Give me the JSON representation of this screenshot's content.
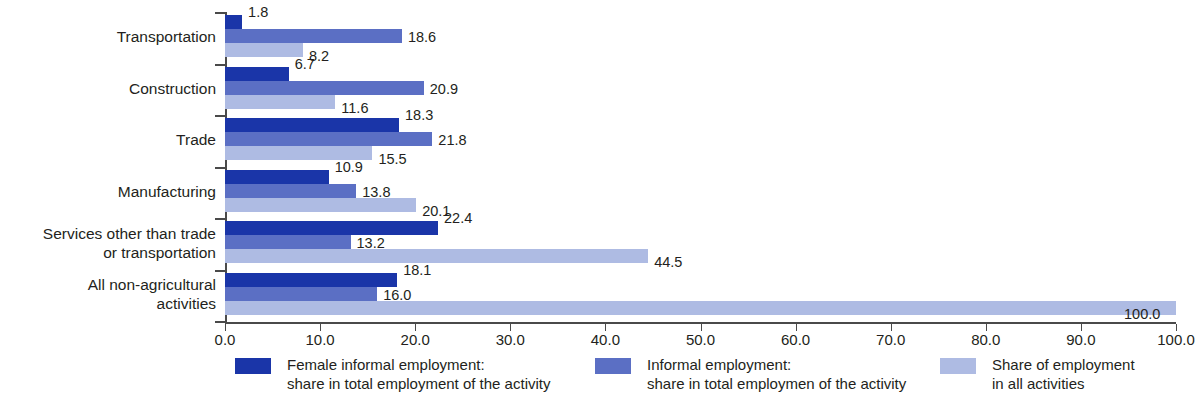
{
  "chart_data": {
    "type": "bar",
    "orientation": "horizontal",
    "title": "",
    "subtitle": "",
    "xlabel": "",
    "ylabel": "",
    "xlim": [
      0,
      100
    ],
    "xticks": [
      "0.0",
      "10.0",
      "20.0",
      "30.0",
      "40.0",
      "50.0",
      "60.0",
      "70.0",
      "80.0",
      "90.0",
      "100.0"
    ],
    "xtick_values": [
      0,
      10,
      20,
      30,
      40,
      50,
      60,
      70,
      80,
      90,
      100
    ],
    "grid": false,
    "legend_position": "bottom",
    "categories": [
      "Transportation",
      "Construction",
      "Trade",
      "Manufacturing",
      "Services other than trade\nor transportation",
      "All non-agricultural\nactivities"
    ],
    "series": [
      {
        "name": "Female informal employment:\nshare in total employment of the activity",
        "color": "#1a35a8",
        "values": [
          1.8,
          6.7,
          18.3,
          10.9,
          22.4,
          18.1
        ],
        "labels": [
          "1.8",
          "6.7",
          "18.3",
          "10.9",
          "22.4",
          "18.1"
        ]
      },
      {
        "name": "Informal employment:\nshare in total employmen of the activity",
        "color": "#5b6fc4",
        "values": [
          18.6,
          20.9,
          21.8,
          13.8,
          13.2,
          16.0
        ],
        "labels": [
          "18.6",
          "20.9",
          "21.8",
          "13.8",
          "13.2",
          "16.0"
        ]
      },
      {
        "name": "Share of employment\nin all activities",
        "color": "#aebbe3",
        "values": [
          8.2,
          11.6,
          15.5,
          20.1,
          44.5,
          100.0
        ],
        "labels": [
          "8.2",
          "11.6",
          "15.5",
          "20.1",
          "44.5",
          "100.0"
        ]
      }
    ]
  },
  "legend": {
    "items": [
      {
        "swatch_color": "#1a35a8",
        "line1": "Female informal employment:",
        "line2": "share in total employment of the activity"
      },
      {
        "swatch_color": "#5b6fc4",
        "line1": "Informal employment:",
        "line2": "share in total employmen of the activity"
      },
      {
        "swatch_color": "#aebbe3",
        "line1": "Share of employment",
        "line2": "in all activities"
      }
    ]
  },
  "axis": {
    "x_labels": [
      "0.0",
      "10.0",
      "20.0",
      "30.0",
      "40.0",
      "50.0",
      "60.0",
      "70.0",
      "80.0",
      "90.0",
      "100.0"
    ],
    "y_labels": [
      "Transportation",
      "Construction",
      "Trade",
      "Manufacturing",
      "Services other than trade\nor transportation",
      "All non-agricultural\nactivities"
    ]
  }
}
